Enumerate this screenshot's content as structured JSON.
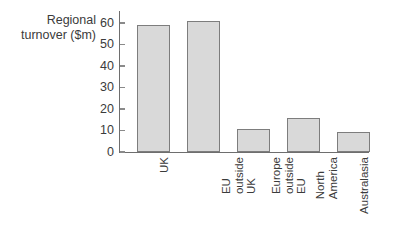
{
  "chart_data": {
    "type": "bar",
    "title": "",
    "xlabel": "",
    "ylabel": "Regional turnover ($m)",
    "ylabel_lines": "Regional\nturnover ($m)",
    "categories": [
      "UK",
      "EU outside UK",
      "Europe outside EU",
      "North America",
      "Australasia"
    ],
    "category_label_lines": [
      "UK",
      "EU\noutside\nUK",
      "Europe\noutside\nEU",
      "North\nAmerica",
      "Australasia"
    ],
    "values": [
      59,
      61,
      10.5,
      16,
      9.5
    ],
    "ylim": [
      0,
      60
    ],
    "ytick_values": [
      0,
      10,
      20,
      30,
      40,
      50,
      60
    ],
    "ytick_labels": [
      "0",
      "10",
      "20",
      "30",
      "40",
      "50",
      "60"
    ],
    "grid": false,
    "legend": false,
    "bar_fill_color": "#d9d9d9",
    "bar_border_color": "#7d7d7d",
    "axis_color": "#6e6e6e",
    "text_color": "#3b3b3b",
    "background_color": "#ffffff"
  }
}
